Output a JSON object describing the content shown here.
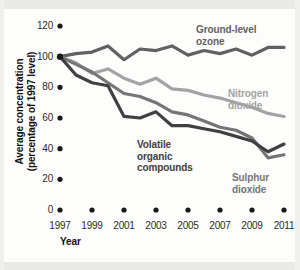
{
  "chart_data": {
    "type": "line",
    "title": "",
    "subtitle": "",
    "xlabel": "Year",
    "ylabel": "Average concentration\n(percentage of 1997 level)",
    "ylabel_lines": [
      "Average concentration",
      "(percentage of 1997 level)"
    ],
    "x": [
      1997,
      1998,
      1999,
      2000,
      2001,
      2002,
      2003,
      2004,
      2005,
      2006,
      2007,
      2008,
      2009,
      2010,
      2011
    ],
    "xlim": [
      1997,
      2011
    ],
    "ylim": [
      0,
      120
    ],
    "yticks": [
      0,
      20,
      40,
      60,
      80,
      100,
      120
    ],
    "ytick_labels": [
      "0",
      "20",
      "40",
      "60",
      "80",
      "100",
      "120"
    ],
    "xticks": [
      1997,
      1999,
      2001,
      2003,
      2005,
      2007,
      2009,
      2011
    ],
    "xtick_labels": [
      "1997",
      "1999",
      "2001",
      "2003",
      "2005",
      "2007",
      "2009",
      "2011"
    ],
    "grid": false,
    "legend_position": "inline-annotations",
    "tick_style": "dots",
    "series": [
      {
        "name": "Ground-level ozone",
        "label_lines": [
          "Ground-level",
          "ozone"
        ],
        "color": "#616161",
        "values": [
          100,
          102,
          103,
          107,
          98,
          105,
          104,
          107,
          101,
          104,
          102,
          105,
          101,
          106,
          106
        ]
      },
      {
        "name": "Nitrogen dioxide",
        "label_lines": [
          "Nitrogen",
          "dioxide"
        ],
        "color": "#a3a3a3",
        "values": [
          100,
          96,
          89,
          92,
          86,
          82,
          86,
          79,
          78,
          75,
          73,
          70,
          67,
          63,
          61
        ]
      },
      {
        "name": "Volatile organic compounds",
        "label_lines": [
          "Volatile",
          "organic",
          "compounds"
        ],
        "color": "#404040",
        "values": [
          100,
          88,
          83,
          81,
          61,
          60,
          64,
          55,
          55,
          53,
          51,
          48,
          45,
          38,
          43
        ]
      },
      {
        "name": "Sulphur dioxide",
        "label_lines": [
          "Sulphur",
          "dioxide"
        ],
        "color": "#757575",
        "values": [
          100,
          95,
          90,
          83,
          76,
          74,
          70,
          64,
          62,
          58,
          54,
          52,
          47,
          34,
          36
        ]
      }
    ]
  },
  "axes": {
    "x_title": "Year"
  }
}
